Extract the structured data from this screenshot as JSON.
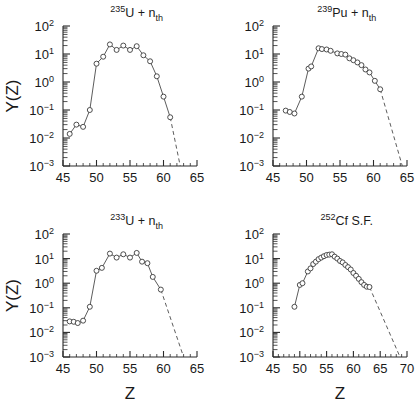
{
  "figure": {
    "ylabel": "Y(Z)",
    "xlabel": "Z",
    "background": "#ffffff",
    "line_color": "#4a4a4a",
    "marker_color": "#3a3a3a"
  },
  "chart_data": [
    {
      "type": "line",
      "panel": "top-left",
      "title": "235U + nth",
      "title_parts": {
        "sup": "235",
        "element": "U",
        "plus": " + n",
        "sub": "th"
      },
      "xlabel": "Z",
      "ylabel": "Y(Z)",
      "xlim": [
        45,
        65
      ],
      "ylim": [
        0.001,
        100
      ],
      "yscale": "log",
      "xticks": [
        45,
        50,
        55,
        60,
        65
      ],
      "yticks": [
        0.001,
        0.01,
        0.1,
        1,
        10,
        100
      ],
      "ytick_labels": [
        "10-3",
        "10-2",
        "10-1",
        "100",
        "101",
        "102"
      ],
      "grid": false,
      "legend": null,
      "x": [
        46.0,
        47.0,
        48.0,
        49.0,
        50.0,
        51.0,
        52.0,
        53.0,
        54.0,
        55.0,
        56.0,
        57.0,
        58.0,
        59.0,
        60.0,
        61.0
      ],
      "y": [
        0.014,
        0.03,
        0.025,
        0.1,
        4.5,
        8.0,
        22.0,
        14.0,
        20.0,
        14.0,
        19.0,
        9.0,
        5.5,
        1.6,
        0.3,
        0.055
      ],
      "dashed_extrapolation": {
        "x": [
          61.0,
          62.5
        ],
        "y": [
          0.055,
          0.001
        ]
      }
    },
    {
      "type": "line",
      "panel": "top-right",
      "title": "239Pu + nth",
      "title_parts": {
        "sup": "239",
        "element": "Pu",
        "plus": " + n",
        "sub": "th"
      },
      "xlabel": "Z",
      "ylabel": "Y(Z)",
      "xlim": [
        45,
        65
      ],
      "ylim": [
        0.001,
        100
      ],
      "yscale": "log",
      "xticks": [
        45,
        50,
        55,
        60,
        65
      ],
      "yticks": [
        0.001,
        0.01,
        0.1,
        1,
        10,
        100
      ],
      "ytick_labels": [
        "10-3",
        "10-2",
        "10-1",
        "100",
        "101",
        "102"
      ],
      "grid": false,
      "legend": null,
      "x": [
        46.9,
        47.5,
        48.2,
        49.3,
        50.3,
        50.7,
        51.8,
        52.3,
        53.0,
        53.6,
        54.6,
        55.2,
        55.8,
        56.4,
        57.0,
        57.6,
        58.2,
        58.8,
        59.4,
        60.2,
        61.0
      ],
      "y": [
        0.095,
        0.085,
        0.075,
        0.3,
        3.0,
        3.6,
        16.0,
        15.0,
        14.5,
        13.0,
        10.5,
        10.0,
        9.5,
        7.0,
        6.0,
        5.0,
        4.0,
        2.8,
        2.2,
        1.1,
        0.55
      ],
      "dashed_extrapolation": {
        "x": [
          61.0,
          64.3
        ],
        "y": [
          0.55,
          0.001
        ]
      }
    },
    {
      "type": "line",
      "panel": "bottom-left",
      "title": "233U + nth",
      "title_parts": {
        "sup": "233",
        "element": "U",
        "plus": " + n",
        "sub": "th"
      },
      "xlabel": "Z",
      "ylabel": "Y(Z)",
      "xlim": [
        45,
        65
      ],
      "ylim": [
        0.001,
        100
      ],
      "yscale": "log",
      "xticks": [
        45,
        50,
        55,
        60,
        65
      ],
      "yticks": [
        0.001,
        0.01,
        0.1,
        1,
        10,
        100
      ],
      "ytick_labels": [
        "10-3",
        "10-2",
        "10-1",
        "100",
        "101",
        "102"
      ],
      "grid": false,
      "legend": null,
      "x": [
        46.0,
        46.6,
        47.2,
        48.0,
        49.0,
        50.0,
        50.8,
        52.0,
        53.0,
        54.0,
        55.0,
        56.0,
        56.8,
        57.6,
        58.4,
        59.6
      ],
      "y": [
        0.028,
        0.027,
        0.024,
        0.03,
        0.11,
        3.2,
        4.2,
        16.0,
        11.0,
        15.0,
        11.0,
        17.0,
        7.5,
        6.5,
        1.8,
        0.55
      ],
      "dashed_extrapolation": {
        "x": [
          59.6,
          63.0
        ],
        "y": [
          0.55,
          0.001
        ]
      }
    },
    {
      "type": "line",
      "panel": "bottom-right",
      "title": "252Cf S.F.",
      "title_parts": {
        "sup": "252",
        "element": "Cf",
        "plus": " S.F.",
        "sub": ""
      },
      "xlabel": "Z",
      "ylabel": "Y(Z)",
      "xlim": [
        45,
        70
      ],
      "ylim": [
        0.001,
        100
      ],
      "yscale": "log",
      "xticks": [
        45,
        50,
        55,
        60,
        65,
        70
      ],
      "yticks": [
        0.001,
        0.01,
        0.1,
        1,
        10,
        100
      ],
      "ytick_labels": [
        "10-3",
        "10-2",
        "10-1",
        "100",
        "101",
        "102"
      ],
      "grid": false,
      "legend": null,
      "x": [
        49.0,
        50.0,
        50.5,
        51.5,
        52.0,
        52.5,
        53.0,
        53.5,
        54.0,
        54.5,
        55.0,
        55.5,
        56.0,
        56.5,
        57.0,
        57.5,
        58.0,
        58.5,
        59.0,
        59.5,
        60.0,
        60.5,
        61.0,
        61.5,
        62.0,
        62.5,
        63.0
      ],
      "y": [
        0.11,
        0.85,
        1.0,
        3.0,
        4.0,
        6.0,
        7.5,
        9.5,
        11.0,
        12.5,
        14.0,
        14.5,
        15.0,
        12.0,
        10.0,
        8.0,
        7.0,
        5.5,
        4.5,
        3.6,
        2.6,
        2.0,
        1.5,
        1.1,
        0.85,
        0.72,
        0.7
      ],
      "dashed_extrapolation": {
        "x": [
          63.0,
          68.7
        ],
        "y": [
          0.7,
          0.001
        ]
      }
    }
  ]
}
